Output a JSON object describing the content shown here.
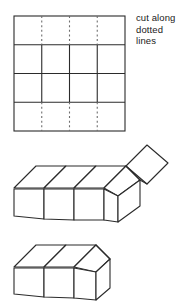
{
  "figure": {
    "title": "cut along dotted lines",
    "type": "paper-folding-instruction",
    "background_color": "#ffffff",
    "stroke_color": "#2b2b2b",
    "dotted_stroke_color": "#6e6e6e",
    "fill_color": "#ffffff"
  },
  "instruction": {
    "lines": [
      "cut along",
      "dotted",
      "lines"
    ],
    "full_text": "cut along dotted lines",
    "color": "#1a1a1a",
    "font_size_px": 9.5
  },
  "panels": [
    {
      "id": "flat-grid",
      "label": "flat net grid",
      "shape": "square-grid",
      "rows": 4,
      "columns": 4,
      "bounds": {
        "x": 14,
        "y": 16,
        "width": 111,
        "height": 115
      },
      "solid_edges": "outer border and all horizontal row dividers",
      "dotted_edges": "vertical dividers in the top row and the bottom row",
      "dotted_column_positions": [
        41.75,
        69.5,
        97.25
      ],
      "row_divider_positions": [
        44.75,
        73.5,
        102.25
      ],
      "description": "A 4 by 4 grid of squares. The vertical dividing lines in the first and last rows are drawn dotted to show where to cut."
    },
    {
      "id": "partially-folded",
      "label": "partially folded strip",
      "shape": "open-tent-with-lifted-flap",
      "bounds": {
        "x": 10,
        "y": 146,
        "width": 155,
        "height": 78
      },
      "description": "A row of four squares folded into an open tent or ridge shape, drawn in three-dimensional oblique projection, with one square flap tilted up at the right end and a side square hanging at the right."
    },
    {
      "id": "completed-house",
      "label": "completed house shape",
      "shape": "closed-tent-house",
      "bounds": {
        "x": 14,
        "y": 240,
        "width": 118,
        "height": 60
      },
      "description": "The finished three-dimensional house or tent form with a pitched roof, two visible wall faces and a closed triangular gable end."
    }
  ]
}
